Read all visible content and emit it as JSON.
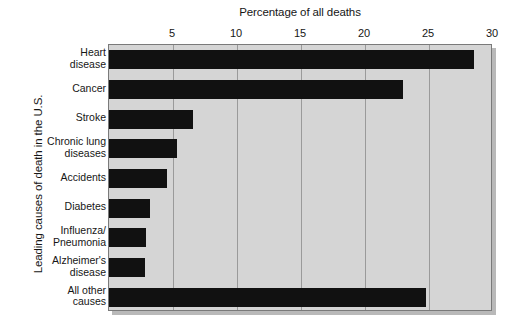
{
  "chart_data": {
    "type": "bar",
    "orientation": "horizontal",
    "title": "",
    "xlabel": "Percentage of all deaths",
    "ylabel": "Leading causes of death in the U.S.",
    "xlim": [
      0,
      30
    ],
    "xticks": [
      5,
      10,
      15,
      20,
      25,
      30
    ],
    "xtick_labels": [
      "5",
      "10",
      "15",
      "20",
      "25",
      "30"
    ],
    "grid": true,
    "legend": "none",
    "bar_color": "#111111",
    "plot_background": "#d5d5d5",
    "categories": [
      "Heart disease",
      "Cancer",
      "Stroke",
      "Chronic lung diseases",
      "Accidents",
      "Diabetes",
      "Influenza/ Pneumonia",
      "Alzheimer's disease",
      "All other causes"
    ],
    "values": [
      28.5,
      23.0,
      6.6,
      5.3,
      4.5,
      3.2,
      2.9,
      2.8,
      24.8
    ]
  },
  "axes": {
    "x_title": "Percentage of all deaths",
    "y_title": "Leading causes of death in the U.S.",
    "x_tick_labels": [
      "5",
      "10",
      "15",
      "20",
      "25",
      "30"
    ]
  },
  "category_labels": [
    {
      "line1": "Heart",
      "line2": "disease"
    },
    {
      "line1": "Cancer",
      "line2": ""
    },
    {
      "line1": "Stroke",
      "line2": ""
    },
    {
      "line1": "Chronic lung",
      "line2": "diseases"
    },
    {
      "line1": "Accidents",
      "line2": ""
    },
    {
      "line1": "Diabetes",
      "line2": ""
    },
    {
      "line1": "Influenza/",
      "line2": "Pneumonia"
    },
    {
      "line1": "Alzheimer's",
      "line2": "disease"
    },
    {
      "line1": "All other",
      "line2": "causes"
    }
  ]
}
